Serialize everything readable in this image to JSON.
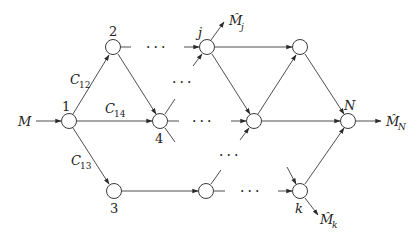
{
  "diagram": {
    "type": "flow-network",
    "colors": {
      "stroke": "#3a3a3a",
      "text": "#222222",
      "node_fill": "#ffffff"
    },
    "nodes": [
      {
        "id": "1",
        "label": "1",
        "x": 69,
        "y": 121
      },
      {
        "id": "2",
        "label": "2",
        "x": 113,
        "y": 47
      },
      {
        "id": "3",
        "label": "3",
        "x": 114,
        "y": 191
      },
      {
        "id": "4",
        "label": "4",
        "x": 160,
        "y": 121
      },
      {
        "id": "j",
        "label": "j",
        "x": 207,
        "y": 47
      },
      {
        "id": "b1",
        "label": "",
        "x": 206,
        "y": 191
      },
      {
        "id": "t2",
        "label": "",
        "x": 300,
        "y": 47
      },
      {
        "id": "m2",
        "label": "",
        "x": 254,
        "y": 121
      },
      {
        "id": "N",
        "label": "N",
        "x": 348,
        "y": 121
      },
      {
        "id": "k",
        "label": "k",
        "x": 300,
        "y": 191
      }
    ],
    "labels": {
      "input": "M",
      "node1": "1",
      "node2": "2",
      "node3": "3",
      "node4": "4",
      "nodej": "j",
      "nodeN": "N",
      "nodek": "k",
      "c12_main": "C",
      "c12_sub": "12",
      "c14_main": "C",
      "c14_sub": "14",
      "c13_main": "C",
      "c13_sub": "13",
      "out_j_main": "M̂",
      "out_j_sub": "j",
      "out_N_main": "M̂",
      "out_N_sub": "N",
      "out_k_main": "M̂",
      "out_k_sub": "k",
      "ellipsis": "···"
    },
    "edges": [
      {
        "from": "M",
        "to": "1"
      },
      {
        "from": "1",
        "to": "2",
        "label": "C12"
      },
      {
        "from": "1",
        "to": "4",
        "label": "C14"
      },
      {
        "from": "1",
        "to": "3",
        "label": "C13"
      },
      {
        "from": "2",
        "to": "4"
      },
      {
        "from": "3",
        "to": "b1"
      },
      {
        "from": "j",
        "to": "t2"
      },
      {
        "from": "j",
        "to": "m2"
      },
      {
        "from": "m2",
        "to": "t2"
      },
      {
        "from": "m2",
        "to": "N"
      },
      {
        "from": "t2",
        "to": "N"
      },
      {
        "from": "k",
        "to": "N"
      },
      {
        "from": "j",
        "to": "M̂j"
      },
      {
        "from": "N",
        "to": "M̂N"
      },
      {
        "from": "k",
        "to": "M̂k"
      }
    ]
  }
}
